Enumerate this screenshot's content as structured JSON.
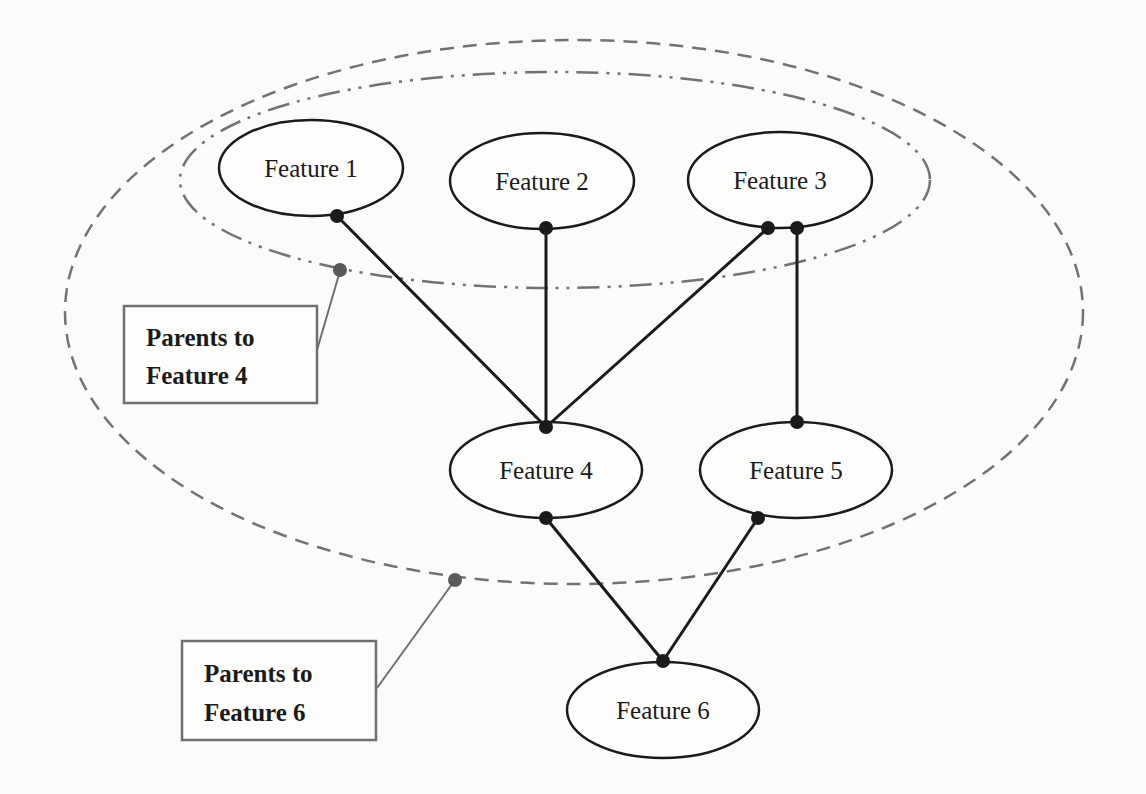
{
  "nodes": [
    {
      "id": "f1",
      "label": "Feature 1",
      "cx": 311,
      "cy": 168,
      "rx": 92,
      "ry": 48
    },
    {
      "id": "f2",
      "label": "Feature 2",
      "cx": 542,
      "cy": 181,
      "rx": 92,
      "ry": 48
    },
    {
      "id": "f3",
      "label": "Feature 3",
      "cx": 780,
      "cy": 180,
      "rx": 92,
      "ry": 48
    },
    {
      "id": "f4",
      "label": "Feature 4",
      "cx": 546,
      "cy": 470,
      "rx": 96,
      "ry": 48
    },
    {
      "id": "f5",
      "label": "Feature 5",
      "cx": 796,
      "cy": 470,
      "rx": 96,
      "ry": 48
    },
    {
      "id": "f6",
      "label": "Feature 6",
      "cx": 663,
      "cy": 710,
      "rx": 96,
      "ry": 48
    }
  ],
  "edges": [
    {
      "from": "f1",
      "to": "f4"
    },
    {
      "from": "f2",
      "to": "f4"
    },
    {
      "from": "f3",
      "to": "f4"
    },
    {
      "from": "f3",
      "to": "f5"
    },
    {
      "from": "f4",
      "to": "f6"
    },
    {
      "from": "f5",
      "to": "f6"
    }
  ],
  "groups": [
    {
      "id": "parents-f4",
      "style": "dash-dot-dot",
      "members": [
        "f1",
        "f2",
        "f3"
      ]
    },
    {
      "id": "parents-f6",
      "style": "dashed",
      "members": [
        "f1",
        "f2",
        "f3",
        "f4",
        "f5"
      ]
    }
  ],
  "callouts": [
    {
      "id": "callout-f4",
      "line1": "Parents to",
      "line2": "Feature 4"
    },
    {
      "id": "callout-f6",
      "line1": "Parents to",
      "line2": "Feature 6"
    }
  ],
  "colors": {
    "node_stroke": "#1a1a1a",
    "group_stroke": "#6f6f6f",
    "background": "#fbfbfa"
  }
}
